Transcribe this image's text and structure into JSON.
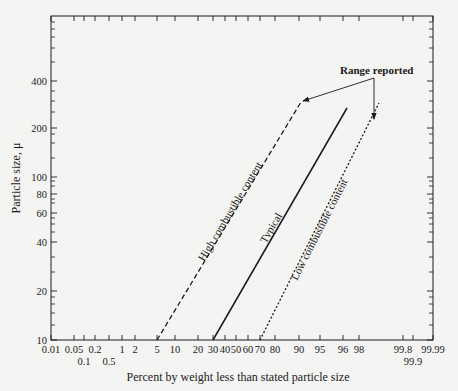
{
  "chart_data": {
    "type": "line",
    "title": "",
    "xlabel": "Percent by weight less than stated particle size",
    "ylabel": "Particle size, μ",
    "x_scale": "probability",
    "y_scale": "log",
    "xlim": [
      0.01,
      99.99
    ],
    "ylim": [
      10,
      1000
    ],
    "grid": false,
    "x_tick_labels_row1": [
      "0.01",
      "0.05",
      "0.2",
      "1",
      "2",
      "5",
      "10",
      "20",
      "30",
      "40",
      "50",
      "60",
      "70",
      "80",
      "90",
      "95",
      "96",
      "98",
      "99.8",
      "99.99"
    ],
    "x_tick_labels_row2": [
      "0.1",
      "0.5",
      "99.9"
    ],
    "y_tick_labels": [
      "10",
      "20",
      "40",
      "60",
      "80",
      "100",
      "200",
      "400"
    ],
    "series": [
      {
        "name": "High combustible content",
        "style": "dashed",
        "points": [
          [
            5,
            10
          ],
          [
            95,
            300
          ]
        ]
      },
      {
        "name": "Typical",
        "style": "solid",
        "points": [
          [
            30,
            10
          ],
          [
            96,
            280
          ]
        ]
      },
      {
        "name": "Low combustible content",
        "style": "dotted",
        "points": [
          [
            70,
            10
          ],
          [
            98.5,
            300
          ]
        ]
      }
    ],
    "annotations": [
      {
        "text": "Range reported",
        "arrows_to": [
          "High combustible content upper end",
          "Low combustible content upper end"
        ]
      }
    ]
  },
  "labels": {
    "ylabel": "Particle size, μ",
    "xlabel": "Percent by weight less than stated particle size",
    "high": "High combustible content",
    "typical": "Typical",
    "low": "Low combustible content",
    "range": "Range reported"
  },
  "x_ticks": [
    {
      "label": "0.01",
      "x": 51,
      "row": 1
    },
    {
      "label": "0.05",
      "x": 74,
      "row": 1
    },
    {
      "label": "0.1",
      "x": 84,
      "row": 2
    },
    {
      "label": "0.2",
      "x": 95,
      "row": 1
    },
    {
      "label": "0.5",
      "x": 109,
      "row": 2
    },
    {
      "label": "1",
      "x": 122,
      "row": 1
    },
    {
      "label": "2",
      "x": 135,
      "row": 1
    },
    {
      "label": "5",
      "x": 157,
      "row": 1
    },
    {
      "label": "10",
      "x": 175,
      "row": 1
    },
    {
      "label": "20",
      "x": 198,
      "row": 1
    },
    {
      "label": "30",
      "x": 213,
      "row": 1
    },
    {
      "label": "40",
      "x": 225,
      "row": 1
    },
    {
      "label": "50",
      "x": 236,
      "row": 1
    },
    {
      "label": "60",
      "x": 248,
      "row": 1
    },
    {
      "label": "70",
      "x": 260,
      "row": 1
    },
    {
      "label": "80",
      "x": 275,
      "row": 1
    },
    {
      "label": "90",
      "x": 299,
      "row": 1
    },
    {
      "label": "95",
      "x": 320,
      "row": 1
    },
    {
      "label": "96",
      "x": 343,
      "row": 1
    },
    {
      "label": "98",
      "x": 359,
      "row": 1
    },
    {
      "label": "99.8",
      "x": 403,
      "row": 1
    },
    {
      "label": "99.9",
      "x": 413,
      "row": 2
    },
    {
      "label": "99.99",
      "x": 433,
      "row": 1
    }
  ],
  "y_ticks": [
    {
      "label": "10",
      "y": 340
    },
    {
      "label": "20",
      "y": 291
    },
    {
      "label": "40",
      "y": 242
    },
    {
      "label": "60",
      "y": 213
    },
    {
      "label": "80",
      "y": 194
    },
    {
      "label": "100",
      "y": 177
    },
    {
      "label": "200",
      "y": 128
    },
    {
      "label": "400",
      "y": 81
    }
  ],
  "y_minor_ticks": [
    325,
    313,
    304,
    297,
    272,
    257,
    232,
    224,
    218,
    203,
    199,
    186,
    181,
    158,
    143,
    134,
    112,
    101,
    91,
    62,
    48,
    37,
    29,
    22
  ]
}
